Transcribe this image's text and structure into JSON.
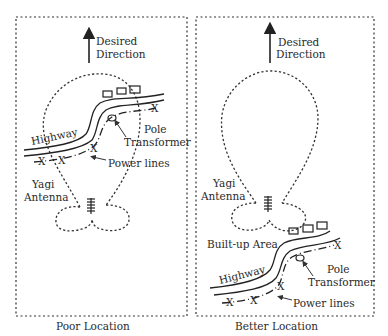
{
  "panels": [
    {
      "id": "poor",
      "caption": "Poor Location",
      "direction_label_1": "Desired",
      "direction_label_2": "Direction",
      "highway_label": "Highway",
      "pole_label": "Pole",
      "transformer_label": "Transformer",
      "power_lines_label": "Power lines",
      "antenna_label_1": "Yagi",
      "antenna_label_2": "Antenna",
      "x_marker": "X"
    },
    {
      "id": "better",
      "caption": "Better  Location",
      "direction_label_1": "Desired",
      "direction_label_2": "Direction",
      "highway_label": "Highway",
      "pole_label": "Pole",
      "transformer_label": "Transformer",
      "power_lines_label": "Power lines",
      "antenna_label_1": "Yagi",
      "antenna_label_2": "Antenna",
      "built_up_label": "Built-up Area",
      "x_marker": "X"
    }
  ],
  "colors": {
    "ink": "#222222",
    "background": "#ffffff"
  }
}
